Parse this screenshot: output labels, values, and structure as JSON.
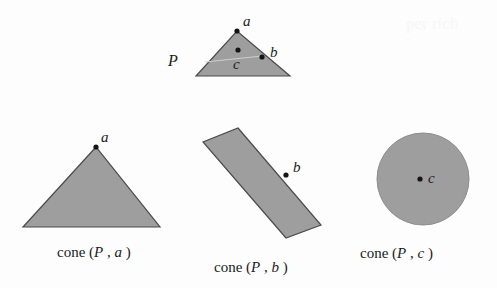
{
  "figure": {
    "background_color": "#fdfdfd",
    "fill_color": "#9e9e9e",
    "stroke_color": "#4a4a4a",
    "point_color": "#151515",
    "text_color": "#1b1b1b"
  },
  "top_shape": {
    "region_label": "P",
    "points": [
      {
        "id": "a",
        "label": "a",
        "x": 237,
        "y": 31
      },
      {
        "id": "b",
        "label": "b",
        "x": 262,
        "y": 57
      },
      {
        "id": "c",
        "label": "c",
        "x": 238,
        "y": 58
      }
    ],
    "polygon": "196,76 237,31 290,76",
    "label_positions": {
      "a": {
        "x": 243,
        "y": 14
      },
      "b": {
        "x": 270,
        "y": 45
      },
      "c": {
        "x": 233,
        "y": 62
      },
      "P": {
        "x": 168,
        "y": 54
      }
    }
  },
  "panels": [
    {
      "id": "cone-a",
      "shape_type": "triangle",
      "caption_prefix": "cone (",
      "caption_region": "P",
      "caption_comma": " , ",
      "caption_point": "a",
      "caption_suffix": " )",
      "caption_full": "cone (P , a )",
      "polygon": "23,227 96,147 160,227",
      "points": [
        {
          "id": "a",
          "label": "a",
          "x": 96,
          "y": 147
        }
      ],
      "label_positions": {
        "a": {
          "x": 101,
          "y": 131
        }
      },
      "caption_position": {
        "x": 57,
        "y": 245
      }
    },
    {
      "id": "cone-b",
      "shape_type": "slab",
      "caption_prefix": "cone (",
      "caption_region": "P",
      "caption_comma": " , ",
      "caption_point": "b",
      "caption_suffix": " )",
      "caption_full": "cone (P , b )",
      "polygon": "238,128 321,225 286,238 203,142",
      "points": [
        {
          "id": "b",
          "label": "b",
          "x": 286,
          "y": 175
        }
      ],
      "label_positions": {
        "b": {
          "x": 293,
          "y": 161
        }
      },
      "caption_position": {
        "x": 214,
        "y": 260
      }
    },
    {
      "id": "cone-c",
      "shape_type": "disk",
      "caption_prefix": "cone (",
      "caption_region": "P",
      "caption_comma": " , ",
      "caption_point": "c",
      "caption_suffix": " )",
      "caption_full": "cone (P , c )",
      "circle": {
        "cx": 423,
        "cy": 179,
        "r": 46
      },
      "points": [
        {
          "id": "c",
          "label": "c",
          "x": 420,
          "y": 179
        }
      ],
      "label_positions": {
        "c": {
          "x": 428,
          "y": 172
        }
      },
      "caption_position": {
        "x": 360,
        "y": 246
      }
    }
  ],
  "artifacts": {
    "ghost_text": "per rich"
  }
}
